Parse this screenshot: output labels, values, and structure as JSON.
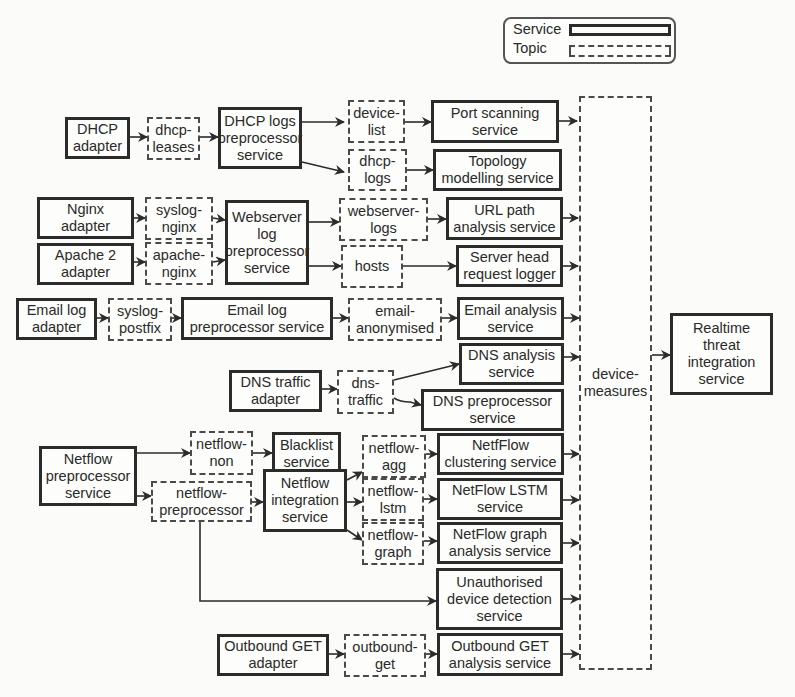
{
  "legend": {
    "service_label": "Service",
    "topic_label": "Topic"
  },
  "nodes": {
    "dhcp_adapter": "DHCP\nadapter",
    "dhcp_leases": "dhcp-\nleases",
    "dhcp_logs_preprocessor": "DHCP logs\npreprocessor\nservice",
    "device_list": "device-\nlist",
    "dhcp_logs": "dhcp-\nlogs",
    "port_scanning": "Port scanning\nservice",
    "topology_modelling": "Topology\nmodelling service",
    "nginx_adapter": "Nginx\nadapter",
    "apache_adapter": "Apache 2\nadapter",
    "syslog_nginx": "syslog-\nnginx",
    "apache_nginx": "apache-\nnginx",
    "webserver_log_preprocessor": "Webserver\nlog\npreprocessor\nservice",
    "webserver_logs": "webserver-\nlogs",
    "hosts": "hosts",
    "url_path_analysis": "URL path\nanalysis service",
    "server_head_logger": "Server head\nrequest logger",
    "email_log_adapter": "Email log\nadapter",
    "syslog_postfix": "syslog-\npostfix",
    "email_log_preprocessor": "Email log\npreprocessor service",
    "email_anonymised": "email-\nanonymised",
    "email_analysis": "Email analysis\nservice",
    "dns_traffic_adapter": "DNS traffic\nadapter",
    "dns_traffic": "dns-\ntraffic",
    "dns_analysis": "DNS analysis\nservice",
    "dns_preprocessor": "DNS preprocessor\nservice",
    "netflow_preprocessor": "Netflow\npreprocessor\nservice",
    "netflow_non": "netflow-\nnon",
    "blacklist": "Blacklist\nservice",
    "netflow_preprocessor_topic": "netflow-\npreprocessor",
    "netflow_integration": "Netflow\nintegration\nservice",
    "netflow_agg": "netflow-\nagg",
    "netflow_lstm": "netflow-\nlstm",
    "netflow_graph": "netflow-\ngraph",
    "netflow_clustering": "NetfFlow\nclustering service",
    "netflow_lstm_service": "NetFlow LSTM\nservice",
    "netflow_graph_analysis": "NetFlow graph\nanalysis service",
    "unauthorised_device": "Unauthorised\ndevice detection\nservice",
    "outbound_get_adapter": "Outbound GET\nadapter",
    "outbound_get": "outbound-\nget",
    "outbound_get_analysis": "Outbound GET\nanalysis service",
    "device_measures": "device-\nmeasures",
    "realtime_threat": "Realtime\nthreat\nintegration\nservice"
  },
  "colors": {
    "line": "#2b2b2b",
    "background": "#fbfbf9"
  }
}
